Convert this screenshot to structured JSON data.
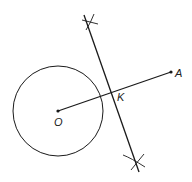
{
  "diagram": {
    "type": "geometric-construction",
    "colors": {
      "stroke": "#1a1a1a",
      "background": "#ffffff"
    },
    "points": {
      "O": {
        "label": "O",
        "x": 58,
        "y": 111
      },
      "A": {
        "label": "A",
        "x": 171,
        "y": 72
      },
      "K": {
        "label": "K",
        "x": 114,
        "y": 91
      }
    },
    "circle": {
      "center": "O",
      "radius": 45
    },
    "segment": {
      "from": "O",
      "to": "A"
    },
    "bisector": {
      "from": {
        "x": 84,
        "y": 15
      },
      "to": {
        "x": 139,
        "y": 172
      },
      "arc_marks": [
        {
          "x": 90,
          "y": 22
        },
        {
          "x": 137,
          "y": 162
        }
      ]
    }
  }
}
